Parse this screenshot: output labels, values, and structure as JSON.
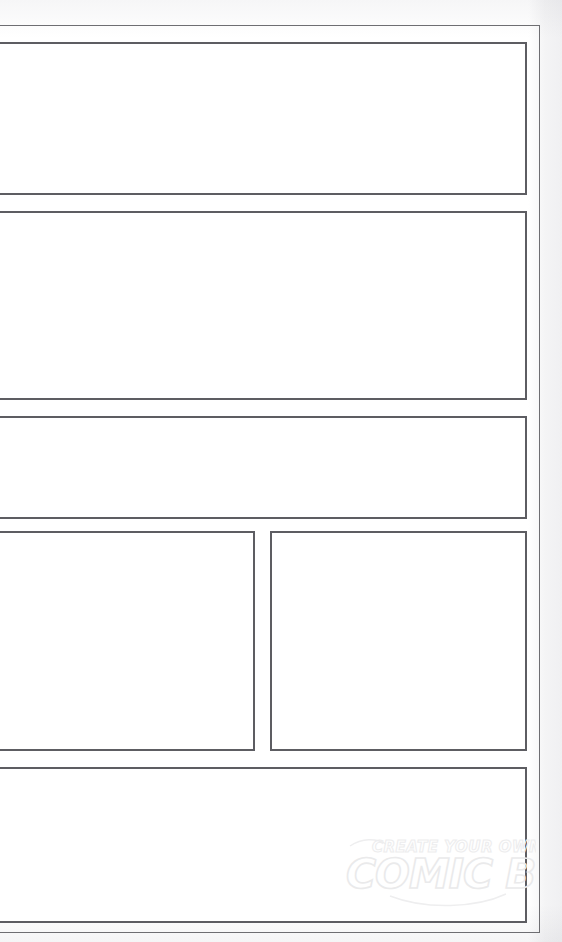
{
  "page": {
    "background_color": "#ffffff",
    "margin_tint_color": "#f2f2f3",
    "frame_color": "#6e6e72",
    "panel_border_color": "#5d5d62",
    "panel_fill_color": "#ffffff",
    "width_px": 562,
    "height_px": 942
  },
  "frame": {
    "name": "page-border",
    "x": -6,
    "y": 25,
    "width": 546,
    "height": 908
  },
  "panels": [
    {
      "id": "panel-1",
      "label": "Panel 1",
      "row": 1,
      "column": 1,
      "x": -4,
      "y": 42,
      "width": 531,
      "height": 153,
      "content": ""
    },
    {
      "id": "panel-2",
      "label": "Panel 2",
      "row": 2,
      "column": 1,
      "x": -4,
      "y": 211,
      "width": 531,
      "height": 189,
      "content": ""
    },
    {
      "id": "panel-3",
      "label": "Panel 3",
      "row": 3,
      "column": 1,
      "x": -4,
      "y": 416,
      "width": 531,
      "height": 103,
      "content": ""
    },
    {
      "id": "panel-4a",
      "label": "Panel 4",
      "row": 4,
      "column": 1,
      "x": -4,
      "y": 531,
      "width": 259,
      "height": 220,
      "content": ""
    },
    {
      "id": "panel-4b",
      "label": "Panel 5",
      "row": 4,
      "column": 2,
      "x": 270,
      "y": 531,
      "width": 257,
      "height": 220,
      "content": ""
    },
    {
      "id": "panel-5",
      "label": "Panel 6",
      "row": 5,
      "column": 1,
      "x": -4,
      "y": 767,
      "width": 531,
      "height": 156,
      "content": ""
    }
  ],
  "watermark": {
    "line_top": "CREATE YOUR OWN",
    "line_main": "COMIC BOOK",
    "stroke_color": "#ebebec",
    "x": 346,
    "y": 832,
    "width": 190,
    "height": 78
  }
}
